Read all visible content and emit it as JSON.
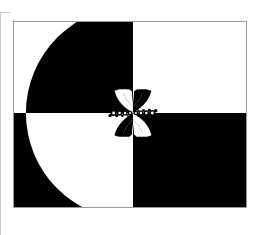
{
  "page": {
    "background_color": "#ffffff",
    "width": 261,
    "height": 235,
    "rule_color": "#c9c9c9"
  },
  "figure": {
    "name": "quadrant-fractal-figure",
    "frame": {
      "x": 13,
      "y": 21,
      "width": 234,
      "height": 187,
      "border_color": "#9a9a9a",
      "border_width": 1
    },
    "colors": {
      "ink": "#000000",
      "paper": "#ffffff"
    },
    "center": {
      "x": 121,
      "y": 93
    },
    "quadrants": [
      {
        "name": "top-left",
        "fill": "paper",
        "note": "white ground with large black quarter disk"
      },
      {
        "name": "top-right",
        "fill": "paper",
        "note": "white ground"
      },
      {
        "name": "bottom-left",
        "fill": "ink",
        "note": "black ground with large white quarter disk"
      },
      {
        "name": "bottom-right",
        "fill": "ink",
        "note": "black ground"
      }
    ],
    "big_arc": {
      "name": "quarter-disk-arc",
      "radius": 108,
      "description": "large circle centred on the quadrant crossing; black in the upper-left quadrant, white in the lower-left quadrant"
    },
    "center_detail": {
      "name": "bowtie-fractal",
      "description": "self-similar hourglass/bowtie cluster of alternating black and white lobes straddling the quadrant crossing",
      "half_width": 24,
      "half_height": 24,
      "lobe_count": 8,
      "bead_count": 9
    }
  }
}
